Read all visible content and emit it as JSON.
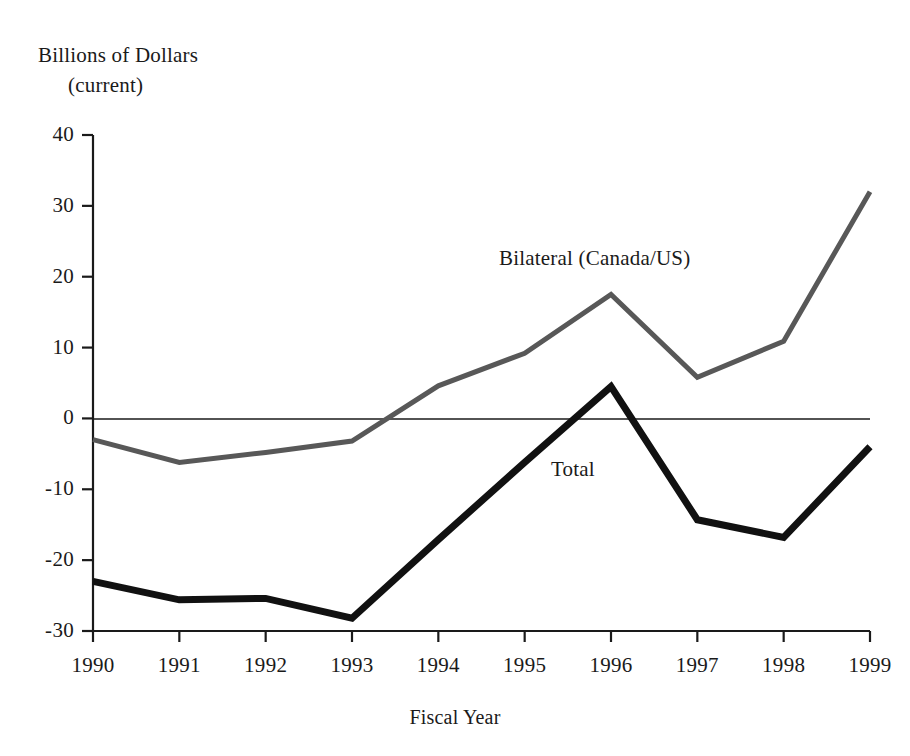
{
  "chart_data": {
    "type": "line",
    "title": "",
    "ylabel_line1": "Billions of Dollars",
    "ylabel_line2": "(current)",
    "xlabel": "Fiscal Year",
    "categories": [
      "1990",
      "1991",
      "1992",
      "1993",
      "1994",
      "1995",
      "1996",
      "1997",
      "1998",
      "1999"
    ],
    "x": [
      1990,
      1991,
      1992,
      1993,
      1994,
      1995,
      1996,
      1997,
      1998,
      1999
    ],
    "ylim": [
      -30,
      40
    ],
    "yticks": [
      40,
      30,
      20,
      10,
      0,
      -10,
      -20,
      -30
    ],
    "ytick_labels": [
      "40",
      "30",
      "20",
      "10",
      "0",
      "-10",
      "-20",
      "-30"
    ],
    "grid": false,
    "legend_position": "inline-annotations",
    "zero_line": true,
    "series": [
      {
        "name": "Bilateral (Canada/US)",
        "color": "#585858",
        "line_width": 5,
        "values": [
          -3.0,
          -6.2,
          -4.8,
          -3.2,
          4.6,
          9.2,
          17.5,
          5.8,
          10.9,
          32.0
        ]
      },
      {
        "name": "Total",
        "color": "#111111",
        "line_width": 7,
        "values": [
          -23.0,
          -25.6,
          -25.4,
          -28.2,
          -17.1,
          -6.2,
          4.5,
          -14.3,
          -16.8,
          -4.0
        ]
      }
    ],
    "annotations": [
      {
        "text": "Bilateral (Canada/US)",
        "x": 1995.7,
        "y": 22.5
      },
      {
        "text": "Total",
        "x": 1996.3,
        "y": -7.5
      }
    ]
  },
  "axes": {
    "y_axis_name": "y-axis",
    "x_axis_name": "x-axis"
  }
}
